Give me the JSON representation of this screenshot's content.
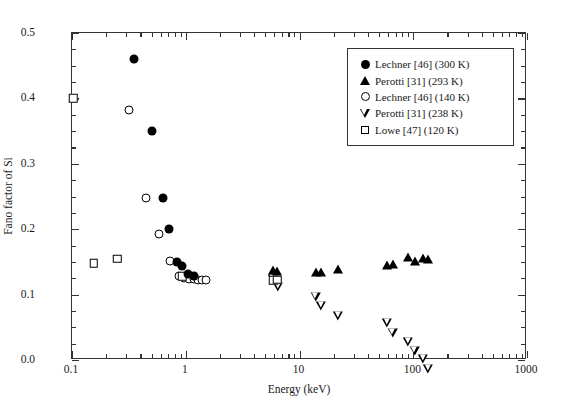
{
  "chart_data": {
    "type": "scatter",
    "title": "",
    "xlabel": "Energy (keV)",
    "ylabel": "Fano factor of Si",
    "xscale": "log",
    "yscale": "linear",
    "xlim": [
      0.1,
      1000
    ],
    "ylim": [
      0.0,
      0.5
    ],
    "grid": false,
    "legend_position": "upper right",
    "xticks": [
      "0.1",
      "1",
      "10",
      "100",
      "1000"
    ],
    "xtick_values": [
      0.1,
      1,
      10,
      100,
      1000
    ],
    "yticks": [
      "0.0",
      "0.1",
      "0.2",
      "0.3",
      "0.4",
      "0.5"
    ],
    "ytick_values": [
      0.0,
      0.1,
      0.2,
      0.3,
      0.4,
      0.5
    ],
    "series": [
      {
        "name": "Lechner [46] (300 K)",
        "marker": "filled-circle",
        "color": "#000000",
        "points": [
          {
            "x": 0.35,
            "y": 0.46
          },
          {
            "x": 0.5,
            "y": 0.35
          },
          {
            "x": 0.63,
            "y": 0.248
          },
          {
            "x": 0.71,
            "y": 0.2
          },
          {
            "x": 0.83,
            "y": 0.15
          },
          {
            "x": 0.93,
            "y": 0.143
          },
          {
            "x": 1.05,
            "y": 0.132
          },
          {
            "x": 1.18,
            "y": 0.128
          }
        ]
      },
      {
        "name": "Perotti [31] (293 K)",
        "marker": "filled-triangle",
        "color": "#000000",
        "points": [
          {
            "x": 5.9,
            "y": 0.137
          },
          {
            "x": 6.4,
            "y": 0.136
          },
          {
            "x": 13.9,
            "y": 0.135
          },
          {
            "x": 15.5,
            "y": 0.134
          },
          {
            "x": 22.0,
            "y": 0.139
          },
          {
            "x": 59.0,
            "y": 0.145
          },
          {
            "x": 66.0,
            "y": 0.147
          },
          {
            "x": 90.0,
            "y": 0.157
          },
          {
            "x": 103.0,
            "y": 0.152
          },
          {
            "x": 122.0,
            "y": 0.156
          },
          {
            "x": 136.0,
            "y": 0.155
          }
        ]
      },
      {
        "name": "Lechner [46] (140 K)",
        "marker": "open-circle",
        "color": "#000000",
        "points": [
          {
            "x": 0.32,
            "y": 0.382
          },
          {
            "x": 0.45,
            "y": 0.248
          },
          {
            "x": 0.58,
            "y": 0.192
          },
          {
            "x": 0.72,
            "y": 0.152
          },
          {
            "x": 0.88,
            "y": 0.128
          },
          {
            "x": 0.97,
            "y": 0.125
          },
          {
            "x": 1.07,
            "y": 0.124
          },
          {
            "x": 1.17,
            "y": 0.124
          },
          {
            "x": 1.27,
            "y": 0.123
          },
          {
            "x": 1.38,
            "y": 0.123
          },
          {
            "x": 1.5,
            "y": 0.123
          }
        ]
      },
      {
        "name": "Perotti [31] (238 K)",
        "marker": "open-down-triangle",
        "color": "#000000",
        "points": [
          {
            "x": 5.9,
            "y": 0.124
          },
          {
            "x": 6.5,
            "y": 0.125
          },
          {
            "x": 13.9,
            "y": 0.124
          },
          {
            "x": 15.5,
            "y": 0.124
          },
          {
            "x": 22.0,
            "y": 0.122
          },
          {
            "x": 59.0,
            "y": 0.125
          },
          {
            "x": 66.0,
            "y": 0.124
          },
          {
            "x": 90.0,
            "y": 0.124
          },
          {
            "x": 103.0,
            "y": 0.124
          },
          {
            "x": 122.0,
            "y": 0.125
          },
          {
            "x": 136.0,
            "y": 0.124
          }
        ]
      },
      {
        "name": "Lowe [47] (120 K)",
        "marker": "open-square",
        "color": "#000000",
        "points": [
          {
            "x": 0.103,
            "y": 0.4
          },
          {
            "x": 0.155,
            "y": 0.148
          },
          {
            "x": 0.25,
            "y": 0.155
          },
          {
            "x": 0.93,
            "y": 0.128
          },
          {
            "x": 5.9,
            "y": 0.122
          },
          {
            "x": 6.4,
            "y": 0.123
          }
        ]
      }
    ]
  },
  "legend": {
    "entries": [
      {
        "label": "Lechner [46] (300 K)",
        "marker": "filled-circle"
      },
      {
        "label": "Perotti [31] (293 K)",
        "marker": "filled-triangle"
      },
      {
        "label": "Lechner [46] (140 K)",
        "marker": "open-circle"
      },
      {
        "label": "Perotti [31] (238 K)",
        "marker": "open-down-triangle"
      },
      {
        "label": "Lowe [47] (120 K)",
        "marker": "open-square"
      }
    ]
  }
}
